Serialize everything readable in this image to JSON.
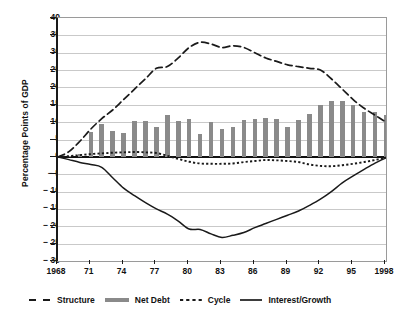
{
  "chart_data": {
    "type": "line",
    "title": "",
    "xlabel": "",
    "ylabel": "Percentage Points of GDP",
    "ylim": [
      -30,
      40
    ],
    "ytick_labels": [
      "40",
      "35",
      "30",
      "25",
      "20",
      "15",
      "10",
      "5",
      "0",
      "− 5",
      "− 10",
      "− 15",
      "− 20",
      "− 25",
      "− 30"
    ],
    "ytick_values": [
      40,
      35,
      30,
      25,
      20,
      15,
      10,
      5,
      0,
      -5,
      -10,
      -15,
      -20,
      -25,
      -30
    ],
    "xlim": [
      1968,
      1998
    ],
    "xtick_labels": [
      "1968",
      "71",
      "74",
      "77",
      "80",
      "83",
      "86",
      "89",
      "92",
      "95",
      "1998"
    ],
    "xtick_values": [
      1968,
      1971,
      1974,
      1977,
      1980,
      1983,
      1986,
      1989,
      1992,
      1995,
      1998
    ],
    "grid": true,
    "legend_position": "below",
    "x": [
      1968,
      1969,
      1970,
      1971,
      1972,
      1973,
      1974,
      1975,
      1976,
      1977,
      1978,
      1979,
      1980,
      1981,
      1982,
      1983,
      1984,
      1985,
      1986,
      1987,
      1988,
      1989,
      1990,
      1991,
      1992,
      1993,
      1994,
      1995,
      1996,
      1997,
      1998
    ],
    "series": [
      {
        "name": "Structure",
        "style": "dashed",
        "color": "#1a1a1a",
        "values": [
          0.0,
          1.5,
          4.5,
          8.0,
          11.0,
          13.5,
          16.5,
          19.5,
          22.5,
          25.5,
          26.0,
          28.5,
          31.5,
          33.0,
          32.5,
          31.5,
          32.0,
          31.5,
          30.0,
          28.5,
          27.5,
          26.5,
          26.0,
          25.5,
          25.0,
          22.5,
          19.5,
          16.5,
          14.0,
          12.0,
          10.0
        ]
      },
      {
        "name": "Net Debt",
        "style": "bar",
        "color": "#8a8a8a",
        "values": [
          0.0,
          0.3,
          0.8,
          7.3,
          9.4,
          7.5,
          6.8,
          10.2,
          10.2,
          8.5,
          12.2,
          10.4,
          11.0,
          6.7,
          10.0,
          8.0,
          8.7,
          10.6,
          10.8,
          11.3,
          10.8,
          8.6,
          10.6,
          12.3,
          14.8,
          16.2,
          16.2,
          15.0,
          13.0,
          12.8,
          12.0
        ]
      },
      {
        "name": "Cycle",
        "style": "dotted",
        "color": "#1a1a1a",
        "values": [
          0.0,
          0.2,
          0.5,
          0.8,
          1.0,
          1.2,
          1.3,
          1.4,
          1.3,
          1.1,
          0.3,
          -0.6,
          -1.4,
          -1.9,
          -2.0,
          -2.0,
          -1.9,
          -1.5,
          -1.2,
          -0.9,
          -1.0,
          -1.2,
          -1.5,
          -2.2,
          -2.6,
          -2.7,
          -2.4,
          -2.0,
          -1.5,
          -0.9,
          -0.2
        ]
      },
      {
        "name": "Interest/Growth",
        "style": "solid",
        "color": "#1a1a1a",
        "values": [
          0.0,
          -0.8,
          -1.6,
          -2.2,
          -3.0,
          -6.0,
          -9.0,
          -11.2,
          -13.2,
          -15.0,
          -16.5,
          -18.5,
          -20.8,
          -20.9,
          -22.2,
          -23.2,
          -22.6,
          -21.8,
          -20.4,
          -19.2,
          -18.0,
          -16.8,
          -15.6,
          -14.0,
          -12.2,
          -10.0,
          -7.5,
          -5.5,
          -3.6,
          -1.8,
          -0.3
        ]
      }
    ]
  },
  "legend": {
    "items": [
      {
        "label": "Structure",
        "icon": "dashed-line-swatch"
      },
      {
        "label": "Net Debt",
        "icon": "thick-gray-line-swatch"
      },
      {
        "label": "Cycle",
        "icon": "dotted-line-swatch"
      },
      {
        "label": "Interest/Growth",
        "icon": "solid-line-swatch"
      }
    ]
  }
}
